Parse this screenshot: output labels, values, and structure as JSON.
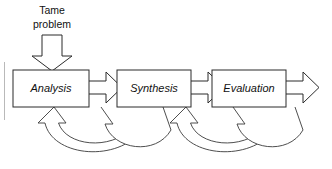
{
  "diagram": {
    "input": {
      "label_line1": "Tame",
      "label_line2": "problem",
      "arrow_name": "input-down-arrow"
    },
    "stages": [
      {
        "id": "analysis",
        "label": "Analysis"
      },
      {
        "id": "synthesis",
        "label": "Synthesis"
      },
      {
        "id": "evaluation",
        "label": "Evaluation"
      }
    ],
    "forward_arrows": [
      {
        "id": "analysis-to-synthesis",
        "from": "analysis",
        "to": "synthesis"
      },
      {
        "id": "synthesis-to-evaluation",
        "from": "synthesis",
        "to": "evaluation"
      },
      {
        "id": "evaluation-output",
        "from": "evaluation",
        "to": "output"
      }
    ],
    "feedback_arrows": [
      {
        "id": "synthesis-to-analysis-inner",
        "from": "synthesis",
        "to": "analysis"
      },
      {
        "id": "synthesis-to-analysis-outer",
        "from": "synthesis",
        "to": "analysis"
      },
      {
        "id": "evaluation-to-synthesis-inner",
        "from": "evaluation",
        "to": "synthesis"
      },
      {
        "id": "evaluation-to-synthesis-outer",
        "from": "evaluation",
        "to": "synthesis"
      }
    ],
    "colors": {
      "stroke": "#2b2b2b",
      "curve_stroke": "#3a3a3a",
      "fill": "#ffffff",
      "text": "#111111",
      "frame": "#b9b9b9"
    }
  }
}
